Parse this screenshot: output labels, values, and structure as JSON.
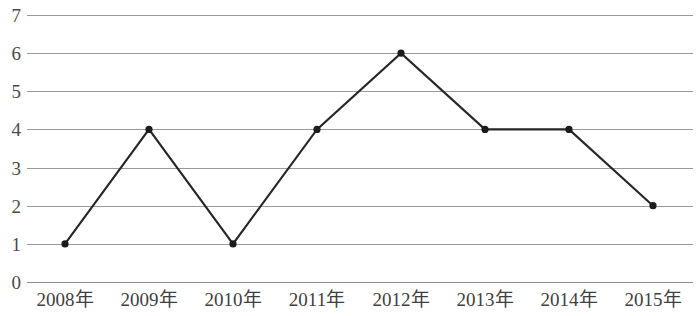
{
  "chart_data": {
    "type": "line",
    "title": "",
    "subtitle": "",
    "xlabel": "",
    "ylabel": "",
    "categories": [
      "2008年",
      "2009年",
      "2010年",
      "2011年",
      "2012年",
      "2013年",
      "2014年",
      "2015年"
    ],
    "values": [
      1,
      4,
      1,
      4,
      6,
      4,
      4,
      2
    ],
    "series": [
      {
        "name": "",
        "values": [
          1,
          4,
          1,
          4,
          6,
          4,
          4,
          2
        ]
      }
    ],
    "ylim": [
      0,
      7
    ],
    "ytick_labels": [
      "7",
      "6",
      "5",
      "4",
      "3",
      "2",
      "1",
      "0"
    ],
    "ytick_values": [
      7,
      6,
      5,
      4,
      3,
      2,
      1,
      0
    ],
    "grid": true,
    "grid_axis": "y",
    "legend": false,
    "legend_position": "none",
    "markers": true,
    "colors": {
      "line": "#262626",
      "marker": "#1c1c1c",
      "gridline": "#9a9a9a",
      "axis_text": "#4a4a4a",
      "background": "#ffffff"
    }
  }
}
